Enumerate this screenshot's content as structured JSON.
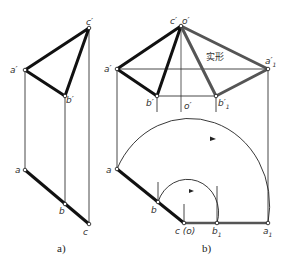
{
  "figure": {
    "panel_a": {
      "caption": "a)",
      "labels": {
        "c_prime": "c′",
        "a_prime": "a′",
        "b_prime": "b′",
        "a": "a",
        "b": "b",
        "c": "c"
      }
    },
    "panel_b": {
      "caption": "b)",
      "true_shape_label": "实形",
      "labels": {
        "c_prime": "c′",
        "o_prime_top": "o′",
        "a_prime": "a′",
        "a1_prime": "a′",
        "a1_sub": "1",
        "b_prime": "b′",
        "o_prime_mid": "o′",
        "b1_prime": "b′",
        "b1_prime_sub": "1",
        "a": "a",
        "b": "b",
        "c_o": "c (o)",
        "b1": "b",
        "b1_sub": "1",
        "a1": "a",
        "a1_bottom_sub": "1"
      }
    },
    "colors": {
      "thick_line": "#111111",
      "gray_thick_line": "#555555",
      "thin_line": "#333333"
    }
  }
}
